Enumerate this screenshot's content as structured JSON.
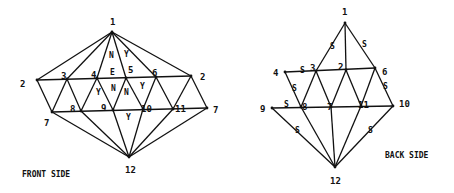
{
  "front": {
    "caption": "FRONT SIDE",
    "vertices": [
      {
        "id": "v1",
        "label": "1"
      },
      {
        "id": "v2L",
        "label": "2"
      },
      {
        "id": "v3",
        "label": "3"
      },
      {
        "id": "v4",
        "label": "4"
      },
      {
        "id": "v5",
        "label": "5"
      },
      {
        "id": "v6",
        "label": "6"
      },
      {
        "id": "v2R",
        "label": "2"
      },
      {
        "id": "v7L",
        "label": "7"
      },
      {
        "id": "v8",
        "label": "8"
      },
      {
        "id": "v9",
        "label": "9"
      },
      {
        "id": "v10",
        "label": "10"
      },
      {
        "id": "v11",
        "label": "11"
      },
      {
        "id": "v7R",
        "label": "7"
      },
      {
        "id": "v12",
        "label": "12"
      }
    ],
    "edges": [
      [
        "v1",
        "v2L"
      ],
      [
        "v1",
        "v3"
      ],
      [
        "v1",
        "v4"
      ],
      [
        "v1",
        "v5"
      ],
      [
        "v1",
        "v6"
      ],
      [
        "v1",
        "v2R"
      ],
      [
        "v2L",
        "v2R"
      ],
      [
        "v7L",
        "v7R"
      ],
      [
        "v2L",
        "v7L"
      ],
      [
        "v3",
        "v7L"
      ],
      [
        "v3",
        "v8"
      ],
      [
        "v4",
        "v8"
      ],
      [
        "v4",
        "v9"
      ],
      [
        "v5",
        "v9"
      ],
      [
        "v5",
        "v10"
      ],
      [
        "v6",
        "v10"
      ],
      [
        "v6",
        "v11"
      ],
      [
        "v2R",
        "v11"
      ],
      [
        "v2R",
        "v7R"
      ],
      [
        "v7L",
        "v12"
      ],
      [
        "v8",
        "v12"
      ],
      [
        "v9",
        "v12"
      ],
      [
        "v10",
        "v12"
      ],
      [
        "v11",
        "v12"
      ],
      [
        "v7R",
        "v12"
      ]
    ],
    "face_labels": [
      {
        "text": "N",
        "face": "1-4-5"
      },
      {
        "text": "Y",
        "face": "1-5-6 (upper)"
      },
      {
        "text": "E",
        "face": "4-5 edge"
      },
      {
        "text": "Y",
        "face": "4-8-9"
      },
      {
        "text": "N",
        "face": "4-9-5"
      },
      {
        "text": "N",
        "face": "5-9-10"
      },
      {
        "text": "Y",
        "face": "5-10-6"
      },
      {
        "text": "Y",
        "face": "9-10-12"
      }
    ]
  },
  "back": {
    "caption": "BACK SIDE",
    "vertices": [
      {
        "id": "b1",
        "label": "1"
      },
      {
        "id": "b4",
        "label": "4"
      },
      {
        "id": "b3",
        "label": "3"
      },
      {
        "id": "b2",
        "label": "2"
      },
      {
        "id": "b6",
        "label": "6"
      },
      {
        "id": "b9",
        "label": "9"
      },
      {
        "id": "b8",
        "label": "8"
      },
      {
        "id": "b7",
        "label": "7"
      },
      {
        "id": "b11",
        "label": "11"
      },
      {
        "id": "b10",
        "label": "10"
      },
      {
        "id": "b12",
        "label": "12"
      }
    ],
    "edges": [
      [
        "b1",
        "b3"
      ],
      [
        "b1",
        "b2"
      ],
      [
        "b1",
        "b6"
      ],
      [
        "b4",
        "b6"
      ],
      [
        "b9",
        "b10"
      ],
      [
        "b4",
        "b8"
      ],
      [
        "b3",
        "b8"
      ],
      [
        "b3",
        "b7"
      ],
      [
        "b2",
        "b7"
      ],
      [
        "b2",
        "b11"
      ],
      [
        "b6",
        "b11"
      ],
      [
        "b6",
        "b10"
      ],
      [
        "b9",
        "b12"
      ],
      [
        "b8",
        "b12"
      ],
      [
        "b7",
        "b12"
      ],
      [
        "b11",
        "b12"
      ],
      [
        "b10",
        "b12"
      ]
    ],
    "edge_marks": [
      {
        "text": "S",
        "edge": "1-3"
      },
      {
        "text": "S",
        "edge": "1-6"
      },
      {
        "text": "S",
        "edge": "4-3"
      },
      {
        "text": "S",
        "edge": "4-8"
      },
      {
        "text": "S",
        "edge": "9-8"
      },
      {
        "text": "S",
        "edge": "6-10"
      },
      {
        "text": "S",
        "edge": "9-12"
      },
      {
        "text": "S",
        "edge": "10-12"
      }
    ]
  }
}
